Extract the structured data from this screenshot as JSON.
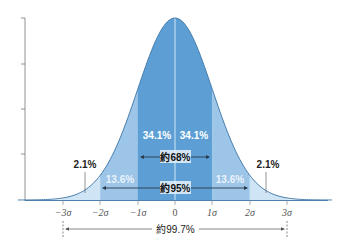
{
  "chart_data": {
    "type": "area",
    "title": "",
    "subtitle": "",
    "xlabel": "",
    "ylabel": "",
    "x_ticks": [
      "−3σ",
      "−2σ",
      "−1σ",
      "0",
      "1σ",
      "2σ",
      "3σ"
    ],
    "x_tick_values": [
      -3,
      -2,
      -1,
      0,
      1,
      2,
      3
    ],
    "xlim": [
      -4.2,
      4.2
    ],
    "y_ticks_count": 5,
    "grid": false,
    "legend": null,
    "bands": [
      {
        "from": -3,
        "to": -2,
        "percent": "2.1%",
        "color": "#cfe4f4"
      },
      {
        "from": -2,
        "to": -1,
        "percent": "13.6%",
        "color": "#9cc5e8"
      },
      {
        "from": -1,
        "to": 0,
        "percent": "34.1%",
        "color": "#5d9fd4"
      },
      {
        "from": 0,
        "to": 1,
        "percent": "34.1%",
        "color": "#5d9fd4"
      },
      {
        "from": 1,
        "to": 2,
        "percent": "13.6%",
        "color": "#9cc5e8"
      },
      {
        "from": 2,
        "to": 3,
        "percent": "2.1%",
        "color": "#cfe4f4"
      }
    ],
    "ranges": [
      {
        "label": "約68%",
        "from": -1,
        "to": 1
      },
      {
        "label": "約95%",
        "from": -2,
        "to": 2
      },
      {
        "label": "約99.7%",
        "from": -3,
        "to": 3
      }
    ],
    "series": [
      {
        "name": "normal density",
        "x": [
          -4,
          -3,
          -2,
          -1,
          0,
          1,
          2,
          3,
          4
        ],
        "values": [
          0.0001,
          0.0044,
          0.054,
          0.242,
          0.399,
          0.242,
          0.054,
          0.0044,
          0.0001
        ]
      }
    ]
  },
  "labels": {
    "band_m3": "2.1%",
    "band_m2": "13.6%",
    "band_m1": "34.1%",
    "band_p1": "34.1%",
    "band_p2": "13.6%",
    "band_p3": "2.1%",
    "range_68": "約68%",
    "range_95": "約95%",
    "range_997": "約99.7%",
    "tick_m3": "−3σ",
    "tick_m2": "−2σ",
    "tick_m1": "−1σ",
    "tick_0": "0",
    "tick_p1": "1σ",
    "tick_p2": "2σ",
    "tick_p3": "3σ"
  },
  "colors": {
    "tail": "#cfe4f4",
    "outer": "#9cc5e8",
    "inner": "#5d9fd4",
    "curve_stroke": "#4a7fae",
    "axis": "#777777",
    "arrow": "#2b3b4e"
  }
}
